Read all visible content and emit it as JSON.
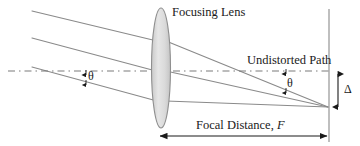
{
  "figure": {
    "type": "optical-ray-diagram",
    "title_text": "Focusing Lens",
    "background_color": "#ffffff",
    "line_color": "#808080",
    "text_color": "#1a1a1a",
    "lens_fill_color": "#dcdcdc",
    "labels": {
      "focusing_lens": "Focusing Lens",
      "undistorted_path": "Undistorted Path",
      "focal_distance_prefix": "Focal Distance, ",
      "focal_distance_symbol": "F",
      "theta_left": "θ",
      "theta_right": "θ",
      "delta": "Δ"
    },
    "geometry": {
      "lens": {
        "center_x": 161,
        "center_y": 68,
        "radius_x": 9.5,
        "radius_y": 60
      },
      "focal_point": {
        "x": 328,
        "y": 107
      },
      "image_plane_x": 329,
      "optical_axis_y": 71,
      "incoming_rays": [
        {
          "start_x": 32,
          "start_y": 11,
          "end_x": 156,
          "end_y": 41
        },
        {
          "start_x": 32,
          "start_y": 38,
          "end_x": 155,
          "end_y": 71
        },
        {
          "start_x": 32,
          "start_y": 67,
          "end_x": 156,
          "end_y": 101
        }
      ],
      "outgoing_rays": [
        {
          "start_x": 167,
          "start_y": 41,
          "end_x": 328,
          "end_y": 107
        },
        {
          "start_x": 167,
          "start_y": 71,
          "end_x": 328,
          "end_y": 107
        },
        {
          "start_x": 167,
          "start_y": 101,
          "end_x": 328,
          "end_y": 107
        }
      ],
      "undistorted_dashed_line": {
        "x1": 8,
        "y1": 71,
        "x2": 329,
        "y2": 71
      },
      "delta_arrow": {
        "x": 338,
        "y_top": 72,
        "y_bottom": 108
      },
      "focal_distance_arrow": {
        "y": 136,
        "x_left": 158,
        "x_right": 328
      },
      "theta_left_marker": {
        "x": 86,
        "y_top": 68,
        "y_bottom": 83
      },
      "theta_right_marker": {
        "x": 285,
        "y_top": 67,
        "y_bottom": 92
      }
    }
  }
}
